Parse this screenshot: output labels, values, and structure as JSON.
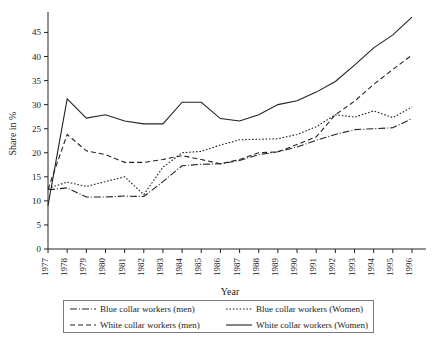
{
  "chart_data": {
    "type": "line",
    "title": "",
    "xlabel": "Year",
    "ylabel": "Share in %",
    "grid": false,
    "legend_position": "bottom",
    "xlim": [
      1977,
      1996
    ],
    "ylim": [
      0,
      48
    ],
    "ytick_labels": [
      "0",
      "5",
      "10",
      "15",
      "20",
      "25",
      "30",
      "35",
      "40",
      "45"
    ],
    "ytick_values": [
      0,
      5,
      10,
      15,
      20,
      25,
      30,
      35,
      40,
      45
    ],
    "x": [
      1977,
      1978,
      1979,
      1980,
      1981,
      1982,
      1983,
      1984,
      1985,
      1986,
      1987,
      1988,
      1989,
      1990,
      1991,
      1992,
      1993,
      1994,
      1995,
      1996
    ],
    "xtick_labels": [
      "1977",
      "1978",
      "1979",
      "1980",
      "1981",
      "1982",
      "1983",
      "1984",
      "1985",
      "1986",
      "1987",
      "1988",
      "1989",
      "1990",
      "1991",
      "1992",
      "1993",
      "1994",
      "1995",
      "1996"
    ],
    "series": [
      {
        "name": "Blue collar workers (men)",
        "style": "dashdot",
        "color": "#222222",
        "values": [
          12.3,
          12.7,
          10.8,
          10.8,
          11.0,
          10.9,
          14.0,
          17.3,
          17.6,
          17.7,
          18.4,
          19.6,
          20.2,
          21.2,
          22.6,
          23.8,
          24.8,
          25.0,
          25.2,
          27.1
        ]
      },
      {
        "name": "Blue collar workers (Women)",
        "style": "dotted",
        "color": "#222222",
        "values": [
          12.6,
          13.9,
          13.0,
          14.0,
          15.0,
          11.3,
          17.0,
          20.0,
          20.3,
          21.6,
          22.7,
          22.8,
          22.9,
          23.8,
          25.4,
          27.9,
          27.4,
          28.7,
          27.3,
          29.5
        ]
      },
      {
        "name": "White collar workers (men)",
        "style": "dashed",
        "color": "#222222",
        "values": [
          12.4,
          23.8,
          20.4,
          19.6,
          18.0,
          18.0,
          18.6,
          19.4,
          18.6,
          17.7,
          18.6,
          20.0,
          20.2,
          21.7,
          23.3,
          27.9,
          30.7,
          34.2,
          37.3,
          40.3
        ]
      },
      {
        "name": "White collar workers (Women)",
        "style": "solid",
        "color": "#222222",
        "values": [
          9.0,
          31.2,
          27.2,
          27.9,
          26.6,
          26.0,
          26.0,
          30.5,
          30.5,
          27.1,
          26.6,
          27.9,
          30.0,
          30.8,
          32.6,
          34.8,
          38.2,
          41.8,
          44.5,
          48.2
        ]
      }
    ]
  },
  "legend": {
    "entries": [
      {
        "label": "Blue collar workers (men)",
        "style": "dashdot"
      },
      {
        "label": "Blue collar workers (Women)",
        "style": "dotted"
      },
      {
        "label": "White collar workers (men)",
        "style": "dashed"
      },
      {
        "label": "White collar workers (Women)",
        "style": "solid"
      }
    ]
  }
}
